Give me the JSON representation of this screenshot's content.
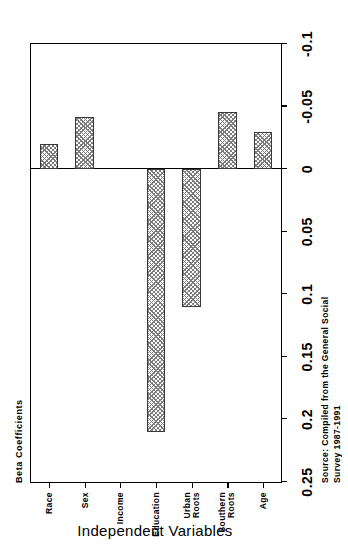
{
  "chart_data": {
    "type": "bar",
    "title": "",
    "orientation": "horizontal",
    "xlabel": "Independent Variables",
    "ylabel": "Beta Coefficients",
    "categories": [
      "Age",
      "Southern\nRoots",
      "Urban\nRoots",
      "Education",
      "Income",
      "Sex",
      "Race"
    ],
    "values": [
      -0.03,
      -0.046,
      0.11,
      0.21,
      0.0,
      -0.042,
      -0.02
    ],
    "series": [
      {
        "name": "Beta Coefficients",
        "values": [
          -0.03,
          -0.046,
          0.11,
          0.21,
          0.0,
          -0.042,
          -0.02
        ]
      }
    ],
    "ylim": [
      -0.1,
      0.25
    ],
    "yticks": [
      0.25,
      0.2,
      0.15,
      0.1,
      0.05,
      0,
      -0.05,
      -0.1
    ],
    "ytick_labels": [
      "0.25",
      "0.2",
      "0.15",
      "0.1",
      "0.05",
      "0",
      "-0.05",
      "-0.1"
    ],
    "grid": false,
    "legend": "none",
    "bar_fill": "#7d7d7d",
    "bar_edge": "#3a3a3a",
    "background": "#ffffff"
  },
  "axes": {
    "value_axis_title": "Beta Coefficients",
    "category_axis_title": "Independent Variables"
  },
  "source": {
    "note": "Source: Compiled from the General Social\nSurvey 1987-1991"
  }
}
